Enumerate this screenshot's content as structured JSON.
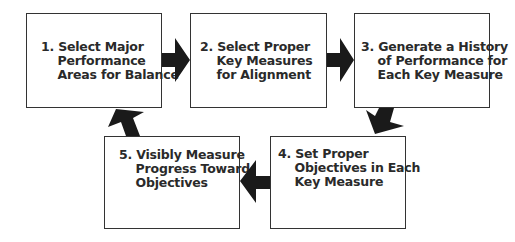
{
  "diagram": {
    "type": "process-cycle",
    "steps": [
      {
        "number": "1.",
        "label": "Select Major\nPerformance\nAreas for Balance",
        "text": "1. Select Major\n    Performance\n    Areas for Balance"
      },
      {
        "number": "2.",
        "label": "Select Proper\nKey Measures\nfor Alignment",
        "text": "2. Select Proper\n    Key Measures\n    for Alignment"
      },
      {
        "number": "3.",
        "label": "Generate a History\nof Performance for\nEach Key Measure",
        "text": "3. Generate a History\n    of Performance for\n    Each Key Measure"
      },
      {
        "number": "4.",
        "label": "Set Proper\nObjectives in Each\nKey Measure",
        "text": "4. Set Proper\n    Objectives in Each\n    Key Measure"
      },
      {
        "number": "5.",
        "label": "Visibly Measure\nProgress Toward\nObjectives",
        "text": "5. Visibly Measure\n    Progress Toward\n    Objectives"
      }
    ],
    "arrows": [
      {
        "from": 1,
        "to": 2,
        "direction": "right"
      },
      {
        "from": 2,
        "to": 3,
        "direction": "right"
      },
      {
        "from": 3,
        "to": 4,
        "direction": "down-left"
      },
      {
        "from": 4,
        "to": 5,
        "direction": "left"
      },
      {
        "from": 5,
        "to": 1,
        "direction": "up-right"
      }
    ],
    "colors": {
      "border": "#333333",
      "arrow": "#1a1a1a",
      "text": "#2a2a2a"
    }
  }
}
